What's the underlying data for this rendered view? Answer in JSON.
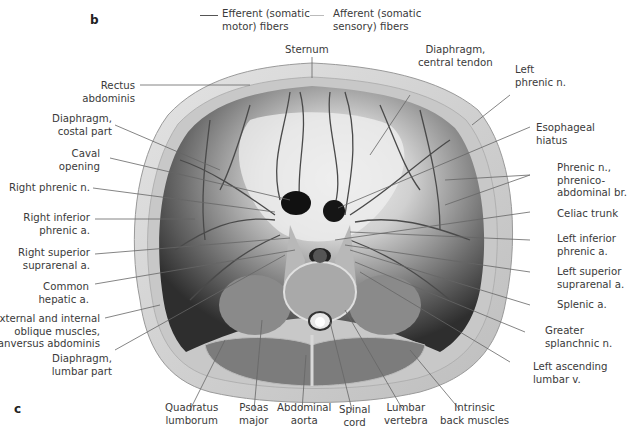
{
  "panel_labels": {
    "top": "b",
    "bottom": "c"
  },
  "legend": {
    "efferent": {
      "label_line1": "Efferent (somatic",
      "label_line2": "motor) fibers",
      "color": "#555555"
    },
    "afferent": {
      "label_line1": "Afferent (somatic",
      "label_line2": "sensory) fibers",
      "color": "#bbbbbb"
    }
  },
  "labels": {
    "sternum": [
      "Sternum"
    ],
    "central_tendon": [
      "Diaphragm,",
      "central tendon"
    ],
    "left_phrenic": [
      "Left",
      "phrenic n."
    ],
    "rectus": [
      "Rectus",
      "abdominis"
    ],
    "costal_part": [
      "Diaphragm,",
      "costal part"
    ],
    "caval_opening": [
      "Caval",
      "opening"
    ],
    "right_phrenic": [
      "Right phrenic n."
    ],
    "right_inf_phrenic": [
      "Right inferior",
      "phrenic a."
    ],
    "right_sup_suprarenal": [
      "Right superior",
      "suprarenal a."
    ],
    "common_hepatic": [
      "Common",
      "hepatic a."
    ],
    "oblique": [
      "External and internal",
      "oblique muscles,",
      "tranversus abdominis"
    ],
    "lumbar_part": [
      "Diaphragm,",
      "lumbar part"
    ],
    "esophageal": [
      "Esophageal",
      "hiatus"
    ],
    "phrenico": [
      "Phrenic n.,",
      "phrenico-",
      "abdominal br."
    ],
    "celiac": [
      "Celiac trunk"
    ],
    "left_inf_phrenic": [
      "Left inferior",
      "phrenic a."
    ],
    "left_sup_suprarenal": [
      "Left superior",
      "suprarenal a."
    ],
    "splenic": [
      "Splenic a."
    ],
    "greater_splanchnic": [
      "Greater",
      "splanchnic n."
    ],
    "left_ascending_lumbar": [
      "Left ascending",
      "lumbar v."
    ],
    "quadratus": [
      "Quadratus",
      "lumborum"
    ],
    "psoas": [
      "Psoas",
      "major"
    ],
    "abdominal_aorta": [
      "Abdominal",
      "aorta"
    ],
    "spinal_cord": [
      "Spinal",
      "cord"
    ],
    "lumbar_vertebra": [
      "Lumbar",
      "vertebra"
    ],
    "intrinsic_back": [
      "Intrinsic",
      "back muscles"
    ]
  },
  "colors": {
    "label_text": "#3a3a3a",
    "leader_line": "#666666",
    "body_wall": "#d6d6d6",
    "diaphragm_dark": "#3c3c3c",
    "diaphragm_light": "#e8e8e8",
    "vessel": "#4a4a4a"
  }
}
